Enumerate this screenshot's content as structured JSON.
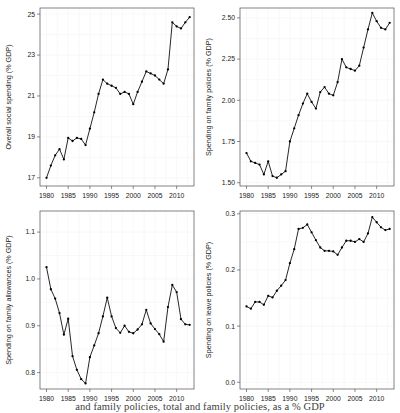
{
  "figure": {
    "width": 400,
    "height": 413,
    "background": "#ffffff",
    "line_color": "#000000",
    "grid_color": "#f2f2f5",
    "frame_color": "#4d4d4d",
    "caption": "and family policies, total and family policies, as a % GDP"
  },
  "chart_data": [
    {
      "id": "overall-social-spending",
      "type": "line",
      "position": "top-left",
      "title": "",
      "xlabel": "",
      "ylabel": "Overall social spending (% GDP)",
      "xlim": [
        1978.5,
        2014.0
      ],
      "ylim": [
        16.6,
        25.3
      ],
      "xticks": [
        1980,
        1985,
        1990,
        1995,
        2000,
        2005,
        2010
      ],
      "yticks": [
        17,
        19,
        21,
        23,
        25
      ],
      "ytick_labels": [
        "17",
        "19",
        "21",
        "23",
        "25"
      ],
      "grid": true,
      "legend": "none",
      "markers": true,
      "x": [
        1980,
        1981,
        1982,
        1983,
        1984,
        1985,
        1986,
        1987,
        1988,
        1989,
        1990,
        1991,
        1992,
        1993,
        1994,
        1995,
        1996,
        1997,
        1998,
        1999,
        2000,
        2001,
        2002,
        2003,
        2004,
        2005,
        2006,
        2007,
        2008,
        2009,
        2010,
        2011,
        2012,
        2013
      ],
      "values": [
        17.0,
        17.6,
        18.1,
        18.4,
        17.9,
        18.95,
        18.8,
        18.95,
        18.9,
        18.6,
        19.4,
        20.2,
        21.1,
        21.8,
        21.6,
        21.5,
        21.4,
        21.1,
        21.2,
        21.1,
        20.6,
        21.2,
        21.7,
        22.2,
        22.1,
        22.0,
        21.8,
        21.6,
        22.3,
        24.6,
        24.4,
        24.3,
        24.6,
        24.85
      ]
    },
    {
      "id": "spending-family-policies",
      "type": "line",
      "position": "top-right",
      "title": "",
      "xlabel": "",
      "ylabel": "Spending on family policies (% GDP)",
      "xlim": [
        1978.5,
        2014.0
      ],
      "ylim": [
        1.48,
        2.56
      ],
      "xticks": [
        1980,
        1985,
        1990,
        1995,
        2000,
        2005,
        2010
      ],
      "yticks": [
        1.5,
        1.75,
        2.0,
        2.25,
        2.5
      ],
      "ytick_labels": [
        "1.50",
        "1.75",
        "2.00",
        "2.25",
        "2.50"
      ],
      "grid": true,
      "legend": "none",
      "markers": true,
      "x": [
        1980,
        1981,
        1982,
        1983,
        1984,
        1985,
        1986,
        1987,
        1988,
        1989,
        1990,
        1991,
        1992,
        1993,
        1994,
        1995,
        1996,
        1997,
        1998,
        1999,
        2000,
        2001,
        2002,
        2003,
        2004,
        2005,
        2006,
        2007,
        2008,
        2009,
        2010,
        2011,
        2012,
        2013
      ],
      "values": [
        1.68,
        1.63,
        1.62,
        1.61,
        1.55,
        1.63,
        1.54,
        1.53,
        1.55,
        1.57,
        1.75,
        1.83,
        1.91,
        1.98,
        2.04,
        1.99,
        1.95,
        2.05,
        2.08,
        2.04,
        2.03,
        2.11,
        2.25,
        2.2,
        2.19,
        2.18,
        2.21,
        2.32,
        2.43,
        2.53,
        2.48,
        2.44,
        2.43,
        2.47
      ]
    },
    {
      "id": "spending-family-allowances",
      "type": "line",
      "position": "bottom-left",
      "title": "",
      "xlabel": "",
      "ylabel": "Spending on family allowances (% GDP)",
      "xlim": [
        1978.5,
        2014.0
      ],
      "ylim": [
        0.765,
        1.145
      ],
      "xticks": [
        1980,
        1985,
        1990,
        1995,
        2000,
        2005,
        2010
      ],
      "yticks": [
        0.8,
        0.9,
        1.0,
        1.1
      ],
      "ytick_labels": [
        "0.8",
        "0.9",
        "1.0",
        "1.1"
      ],
      "grid": true,
      "legend": "none",
      "markers": true,
      "x": [
        1980,
        1981,
        1982,
        1983,
        1984,
        1985,
        1986,
        1987,
        1988,
        1989,
        1990,
        1991,
        1992,
        1993,
        1994,
        1995,
        1996,
        1997,
        1998,
        1999,
        2000,
        2001,
        2002,
        2003,
        2004,
        2005,
        2006,
        2007,
        2008,
        2009,
        2010,
        2011,
        2012,
        2013
      ],
      "values": [
        1.025,
        0.978,
        0.958,
        0.927,
        0.881,
        0.915,
        0.835,
        0.806,
        0.786,
        0.777,
        0.833,
        0.858,
        0.884,
        0.92,
        0.96,
        0.92,
        0.895,
        0.885,
        0.9,
        0.887,
        0.884,
        0.892,
        0.903,
        0.934,
        0.905,
        0.893,
        0.882,
        0.866,
        0.94,
        0.987,
        0.972,
        0.914,
        0.903,
        0.902
      ]
    },
    {
      "id": "spending-leave-policies",
      "type": "line",
      "position": "bottom-right",
      "title": "",
      "xlabel": "",
      "ylabel": "Spending on leave policies (% GDP)",
      "xlim": [
        1978.5,
        2014.0
      ],
      "ylim": [
        -0.012,
        0.305
      ],
      "xticks": [
        1980,
        1985,
        1990,
        1995,
        2000,
        2005,
        2010
      ],
      "yticks": [
        0.0,
        0.1,
        0.2,
        0.3
      ],
      "ytick_labels": [
        "0.0",
        "0.1",
        "0.2",
        "0.3"
      ],
      "grid": true,
      "legend": "none",
      "markers": true,
      "x": [
        1980,
        1981,
        1982,
        1983,
        1984,
        1985,
        1986,
        1987,
        1988,
        1989,
        1990,
        1991,
        1992,
        1993,
        1994,
        1995,
        1996,
        1997,
        1998,
        1999,
        2000,
        2001,
        2002,
        2003,
        2004,
        2005,
        2006,
        2007,
        2008,
        2009,
        2010,
        2011,
        2012,
        2013
      ],
      "values": [
        0.135,
        0.131,
        0.143,
        0.143,
        0.138,
        0.154,
        0.151,
        0.163,
        0.172,
        0.182,
        0.212,
        0.237,
        0.273,
        0.275,
        0.281,
        0.267,
        0.253,
        0.24,
        0.234,
        0.234,
        0.233,
        0.227,
        0.24,
        0.252,
        0.252,
        0.25,
        0.255,
        0.25,
        0.265,
        0.294,
        0.285,
        0.276,
        0.271,
        0.273
      ]
    }
  ]
}
